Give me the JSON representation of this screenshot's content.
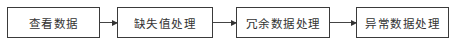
{
  "diagram": {
    "type": "flowchart",
    "direction": "left-to-right",
    "nodes": [
      {
        "id": "n1",
        "label": "查看数据"
      },
      {
        "id": "n2",
        "label": "缺失值处理"
      },
      {
        "id": "n3",
        "label": "冗余数据处理"
      },
      {
        "id": "n4",
        "label": "异常数据处理"
      }
    ],
    "edges": [
      {
        "from": "n1",
        "to": "n2"
      },
      {
        "from": "n2",
        "to": "n3"
      },
      {
        "from": "n3",
        "to": "n4"
      }
    ]
  }
}
